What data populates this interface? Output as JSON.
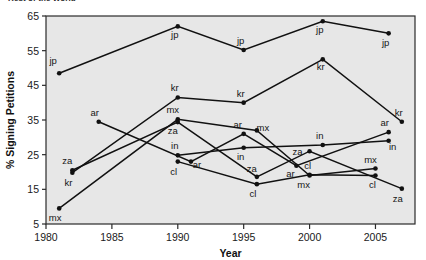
{
  "figure": {
    "clipped_title": "Rest of the World",
    "plot_bg": "#e7e7e7",
    "frame_color": "#2b2b2b",
    "series_color": "#111111"
  },
  "chart_data": {
    "type": "line",
    "title": "Rest of the World",
    "xlabel": "Year",
    "ylabel": "% Signing Petitions",
    "xlim": [
      1980,
      2008
    ],
    "ylim": [
      5,
      65
    ],
    "xticks": [
      1980,
      1985,
      1990,
      1995,
      2000,
      2005
    ],
    "yticks": [
      5,
      15,
      25,
      35,
      45,
      55,
      65
    ],
    "grid": false,
    "legend": "point-labels",
    "marker": "filled-circle",
    "series": [
      {
        "name": "jp",
        "label": "jp",
        "points": [
          {
            "x": 1981,
            "y": 48.5,
            "label": "jp",
            "lx": -6,
            "ly": -9
          },
          {
            "x": 1990,
            "y": 62.0,
            "label": "jp",
            "lx": -3,
            "ly": 12
          },
          {
            "x": 1995,
            "y": 55.2,
            "label": "jp",
            "lx": -3,
            "ly": -6
          },
          {
            "x": 2001,
            "y": 63.5,
            "label": "jp",
            "lx": -3,
            "ly": 12
          },
          {
            "x": 2006,
            "y": 60.0,
            "label": "jp",
            "lx": -3,
            "ly": 13
          }
        ]
      },
      {
        "name": "kr",
        "label": "kr",
        "points": [
          {
            "x": 1982,
            "y": 19.8,
            "label": "kr",
            "lx": -4,
            "ly": 13
          },
          {
            "x": 1990,
            "y": 41.5,
            "label": "kr",
            "lx": -3,
            "ly": -6
          },
          {
            "x": 1995,
            "y": 40.0,
            "label": "kr",
            "lx": -3,
            "ly": -6
          },
          {
            "x": 2001,
            "y": 52.5,
            "label": "kr",
            "lx": -2,
            "ly": 11
          },
          {
            "x": 2007,
            "y": 34.5,
            "label": "kr",
            "lx": -3,
            "ly": -6
          }
        ]
      },
      {
        "name": "mx",
        "label": "mx",
        "points": [
          {
            "x": 1981,
            "y": 9.5,
            "label": "mx",
            "lx": -4,
            "ly": 13
          },
          {
            "x": 1990,
            "y": 35.2,
            "label": "mx",
            "lx": -5,
            "ly": -6
          },
          {
            "x": 1996,
            "y": 32.0,
            "label": "mx",
            "lx": 6,
            "ly": 1
          },
          {
            "x": 2000,
            "y": 19.0,
            "label": "mx",
            "lx": -6,
            "ly": 13
          },
          {
            "x": 2005,
            "y": 21.0,
            "label": "mx",
            "lx": -5,
            "ly": -6
          }
        ]
      },
      {
        "name": "za",
        "label": "za",
        "points": [
          {
            "x": 1982,
            "y": 20.5,
            "label": "za",
            "lx": -5,
            "ly": -6
          },
          {
            "x": 1990,
            "y": 34.4,
            "label": "za",
            "lx": -5,
            "ly": 12
          },
          {
            "x": 1996,
            "y": 18.6,
            "label": "za",
            "lx": -5,
            "ly": -5
          },
          {
            "x": 2000,
            "y": 26.0,
            "label": "za",
            "lx": -12,
            "ly": 4
          },
          {
            "x": 2007,
            "y": 15.2,
            "label": "za",
            "lx": -4,
            "ly": 13
          }
        ]
      },
      {
        "name": "ar",
        "label": "ar",
        "points": [
          {
            "x": 1984,
            "y": 34.5,
            "label": "ar",
            "lx": -4,
            "ly": -6
          },
          {
            "x": 1991,
            "y": 23.0,
            "label": "ar",
            "lx": 6,
            "ly": 6
          },
          {
            "x": 1995,
            "y": 31.0,
            "label": "ar",
            "lx": -6,
            "ly": -6
          },
          {
            "x": 1999,
            "y": 21.8,
            "label": "ar",
            "lx": -6,
            "ly": 11
          },
          {
            "x": 2006,
            "y": 31.5,
            "label": "ar",
            "lx": -4,
            "ly": -6
          }
        ]
      },
      {
        "name": "in",
        "label": "in",
        "points": [
          {
            "x": 1990,
            "y": 24.8,
            "label": "in",
            "lx": -3,
            "ly": -6
          },
          {
            "x": 1995,
            "y": 27.0,
            "label": "in",
            "lx": -3,
            "ly": 12
          },
          {
            "x": 2001,
            "y": 27.8,
            "label": "in",
            "lx": -3,
            "ly": -6
          },
          {
            "x": 2006,
            "y": 29.0,
            "label": "in",
            "lx": 4,
            "ly": 9
          }
        ]
      },
      {
        "name": "cl",
        "label": "cl",
        "points": [
          {
            "x": 1990,
            "y": 23.0,
            "label": "cl",
            "lx": -4,
            "ly": 13
          },
          {
            "x": 1996,
            "y": 16.5,
            "label": "cl",
            "lx": -4,
            "ly": 13
          },
          {
            "x": 2000,
            "y": 19.2,
            "label": "cl",
            "lx": -2,
            "ly": -6
          },
          {
            "x": 2005,
            "y": 19.0,
            "label": "cl",
            "lx": -3,
            "ly": 13
          }
        ]
      }
    ]
  }
}
